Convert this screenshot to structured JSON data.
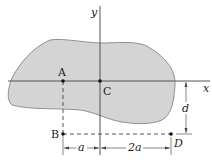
{
  "diagram": {
    "colors": {
      "area_fill": "#d4d4d4",
      "area_stroke": "#7a7a7a",
      "axis": "#555555",
      "text": "#222222"
    },
    "axes": {
      "x_label": "x",
      "y_label": "y"
    },
    "points": {
      "A": "A",
      "B": "B",
      "C": "C",
      "D": "D"
    },
    "dimensions": {
      "horizontal_left": "a",
      "horizontal_right": "2a",
      "vertical": "d"
    }
  }
}
